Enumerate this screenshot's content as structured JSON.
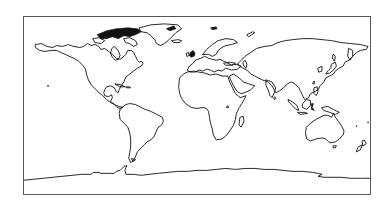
{
  "map": {
    "projection": "equirectangular",
    "extent": {
      "lon": [
        -180,
        180
      ],
      "lat": [
        -90,
        90
      ]
    },
    "features": [
      "coastlines"
    ],
    "colors": {
      "coastline": "#111111",
      "background": "#ffffff",
      "frame": "#555555"
    },
    "landmasses": [
      "north-america",
      "greenland",
      "canadian-arctic-archipelago",
      "south-america",
      "europe",
      "africa",
      "madagascar",
      "asia",
      "japan",
      "indonesia",
      "australia",
      "new-zealand",
      "antarctica",
      "hawaii",
      "british-isles",
      "iceland",
      "svalbard",
      "novaya-zemlya",
      "sri-lanka",
      "tasmania",
      "new-guinea",
      "philippines",
      "borneo"
    ]
  }
}
